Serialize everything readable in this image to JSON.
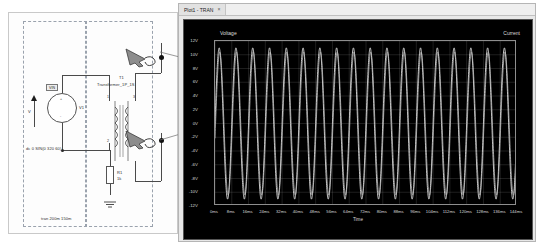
{
  "window": {
    "title": "Plot1 - TRAN",
    "close_label": "×"
  },
  "schematic": {
    "source": {
      "ref": "V1",
      "terminal_top": "+",
      "terminal_bottom": "-",
      "badge": "VIN",
      "spice_line": "dc 0 SIN(0 320 60)"
    },
    "transformer": {
      "ref": "T1",
      "model": "Transformer_1P_1S",
      "pin_1": "1",
      "pin_2": "2",
      "pin_3": "3",
      "pin_4": "4"
    },
    "resistor": {
      "ref": "R1",
      "value": "1k"
    },
    "ground_label": "",
    "net_label_v": "V",
    "directive": "tran 200m 150m",
    "probe_names": [
      "voltage-probe",
      "current-probe"
    ]
  },
  "plot": {
    "left_series_label": "Voltage",
    "right_series_label": "Current",
    "xaxis_title": "Time",
    "yticks": [
      "12V",
      "10V",
      "8V",
      "6V",
      "4V",
      "2V",
      "0V",
      "-2V",
      "-4V",
      "-6V",
      "-8V",
      "-10V",
      "-12V"
    ],
    "xticks": [
      "0ms",
      "8ms",
      "16ms",
      "24ms",
      "32ms",
      "40ms",
      "48ms",
      "56ms",
      "64ms",
      "72ms",
      "80ms",
      "88ms",
      "96ms",
      "104ms",
      "112ms",
      "120ms",
      "128ms",
      "136ms",
      "144ms"
    ],
    "colors": {
      "background": "#000000",
      "grid": "#c8c8c8",
      "trace": "#dedede",
      "text": "#d8d8d8"
    }
  },
  "chart_data": {
    "type": "line",
    "title": "Plot1 - TRAN",
    "xlabel": "Time",
    "ylabel": "Voltage",
    "y2label": "Current",
    "xlim": [
      0,
      152
    ],
    "ylim": [
      -12,
      12
    ],
    "xunit": "ms",
    "yunit": "V",
    "grid": true,
    "legend_position": "top-inside",
    "series": [
      {
        "name": "Voltage",
        "waveform": "sine",
        "amplitude": 11.0,
        "frequency_hz": 120,
        "phase_deg": 0,
        "offset": 0,
        "n_cycles": 18,
        "color": "#dedede"
      },
      {
        "name": "Current",
        "waveform": "sine",
        "amplitude": 10.4,
        "frequency_hz": 120,
        "phase_deg": 12,
        "offset": 0,
        "n_cycles": 18,
        "color": "#bdbdbd"
      }
    ],
    "categories": [],
    "values": []
  }
}
